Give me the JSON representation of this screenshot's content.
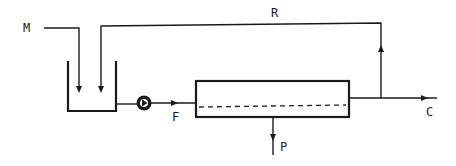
{
  "diagram": {
    "labels": {
      "feed_makeup": "M",
      "recycle": "R",
      "feed": "F",
      "concentrate": "C",
      "permeate": "P"
    },
    "components": [
      {
        "id": "tank",
        "type": "feed tank"
      },
      {
        "id": "pump",
        "type": "pump"
      },
      {
        "id": "module",
        "type": "membrane module"
      }
    ],
    "streams": [
      {
        "from": "M",
        "to": "tank"
      },
      {
        "from": "tank",
        "to": "pump"
      },
      {
        "from": "pump",
        "to": "module",
        "label": "F"
      },
      {
        "from": "module",
        "to": "C"
      },
      {
        "from": "module",
        "to": "tank",
        "label": "R"
      },
      {
        "from": "module",
        "to": "P"
      }
    ],
    "colors": {
      "ink": "#1a1a1a",
      "background": "#ffffff"
    }
  }
}
